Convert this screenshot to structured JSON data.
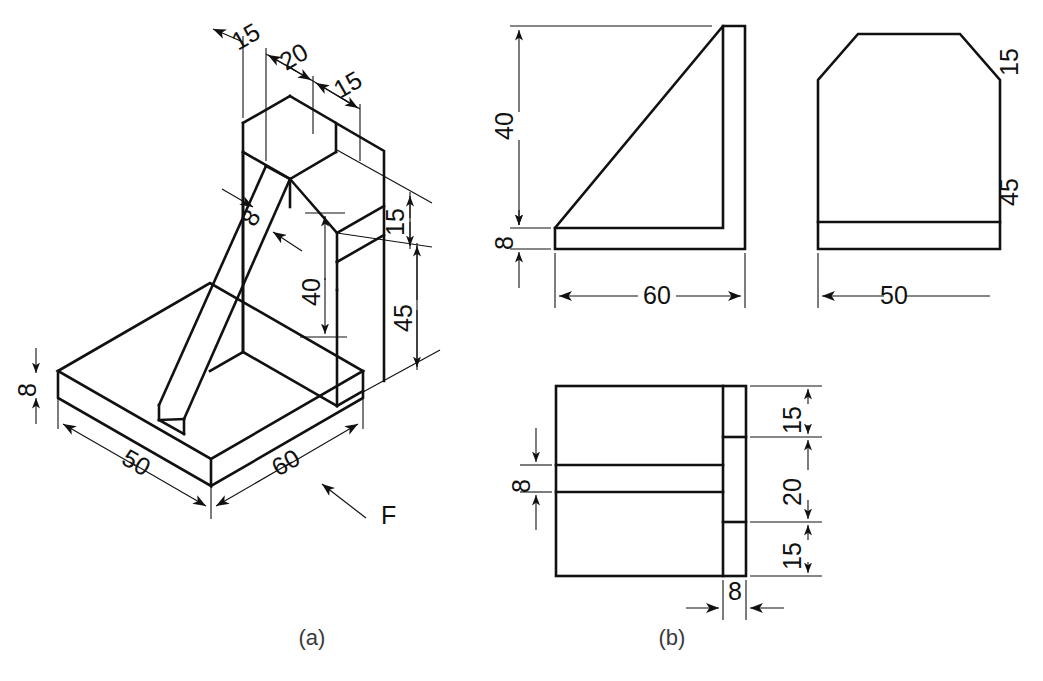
{
  "figure": {
    "background_color": "#ffffff",
    "line_color": "#111111",
    "captions": [
      {
        "id": "a",
        "label": "(a)",
        "x": 312,
        "y": 638
      },
      {
        "id": "b",
        "label": "(b)",
        "x": 672,
        "y": 638
      }
    ]
  },
  "isometric_view": {
    "name": "pictorial-isometric-view",
    "caption": "(a)",
    "direction_marker": {
      "label": "F",
      "meaning": "front-view-direction"
    },
    "dimensions": [
      {
        "id": "iso-top-15-left",
        "value": "15",
        "x": 250,
        "y": 44,
        "rotation": -30
      },
      {
        "id": "iso-top-20",
        "value": "20",
        "x": 296,
        "y": 66,
        "rotation": -30
      },
      {
        "id": "iso-top-15-right",
        "value": "15",
        "x": 352,
        "y": 94,
        "rotation": -30
      },
      {
        "id": "iso-rib-8",
        "value": "8",
        "x": 258,
        "y": 216,
        "rotation": -60
      },
      {
        "id": "iso-height-40",
        "value": "40",
        "x": 322,
        "y": 290,
        "rotation": -90
      },
      {
        "id": "iso-chamfer-15",
        "value": "15",
        "x": 404,
        "y": 215,
        "rotation": -90
      },
      {
        "id": "iso-height-45",
        "value": "45",
        "x": 412,
        "y": 315,
        "rotation": -90
      },
      {
        "id": "iso-base-8",
        "value": "8",
        "x": 36,
        "y": 378,
        "rotation": -90
      },
      {
        "id": "iso-depth-50",
        "value": "50",
        "x": 134,
        "y": 466,
        "rotation": 30
      },
      {
        "id": "iso-width-60",
        "value": "60",
        "x": 288,
        "y": 466,
        "rotation": -30
      }
    ]
  },
  "orthographic_views": {
    "name": "orthographic-projection-views",
    "caption": "(b)",
    "front_view": {
      "name": "front-view",
      "dimensions": [
        {
          "id": "front-40",
          "value": "40",
          "x": 512,
          "y": 162,
          "rotation": -90
        },
        {
          "id": "front-8",
          "value": "8",
          "x": 512,
          "y": 236,
          "rotation": -90
        },
        {
          "id": "front-60",
          "value": "60",
          "x": 656,
          "y": 296,
          "rotation": 0
        }
      ]
    },
    "side_view": {
      "name": "side-view",
      "dimensions": [
        {
          "id": "side-15",
          "value": "15",
          "x": 1018,
          "y": 70,
          "rotation": -90
        },
        {
          "id": "side-45",
          "value": "45",
          "x": 1018,
          "y": 192,
          "rotation": -90
        },
        {
          "id": "side-50",
          "value": "50",
          "x": 884,
          "y": 296,
          "rotation": 0
        }
      ]
    },
    "top_view": {
      "name": "top-view",
      "dimensions": [
        {
          "id": "top-8-left",
          "value": "8",
          "x": 536,
          "y": 478,
          "rotation": -90
        },
        {
          "id": "top-15-upper",
          "value": "15",
          "x": 800,
          "y": 422,
          "rotation": -90
        },
        {
          "id": "top-20",
          "value": "20",
          "x": 800,
          "y": 492,
          "rotation": -90
        },
        {
          "id": "top-15-lower",
          "value": "15",
          "x": 800,
          "y": 555,
          "rotation": -90
        },
        {
          "id": "top-8-bottom",
          "value": "8",
          "x": 760,
          "y": 596,
          "rotation": 0
        }
      ]
    }
  },
  "part_dimensions_mm": {
    "overall_width": 60,
    "overall_depth": 50,
    "overall_height": 45,
    "base_thickness": 8,
    "wall_thickness": 8,
    "vertical_wall_height_above_base": 40,
    "chamfer_height": 15,
    "rib_thickness": 8,
    "top_segments": [
      15,
      20,
      15
    ]
  }
}
